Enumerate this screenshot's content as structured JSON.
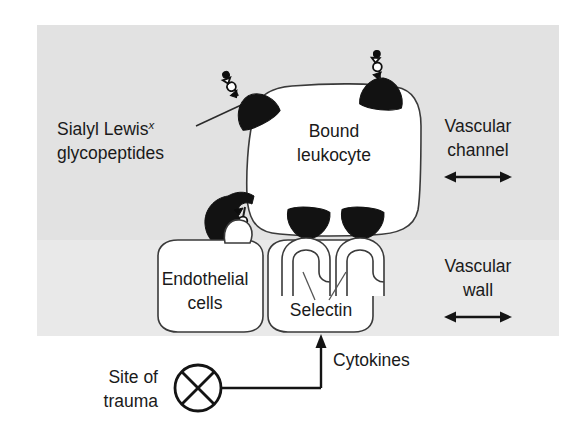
{
  "figure": {
    "background_color": "#ffffff",
    "panel_color_upper": "#e3e3e3",
    "panel_color_lower": "#e9e9e9",
    "ink_color": "#1a1a1a"
  },
  "labels": {
    "sialyl_lewis_line1": "Sialyl Lewis",
    "sialyl_lewis_superscript": "x",
    "sialyl_lewis_line2": "glycopeptides",
    "leukocyte_line1": "Bound",
    "leukocyte_line2": "leukocyte",
    "vascular_channel_line1": "Vascular",
    "vascular_channel_line2": "channel",
    "vascular_wall_line1": "Vascular",
    "vascular_wall_line2": "wall",
    "endothelial_line1": "Endothelial",
    "endothelial_line2": "cells",
    "selectin": "Selectin",
    "cytokines": "Cytokines",
    "trauma_line1": "Site of",
    "trauma_line2": "trauma"
  },
  "icons": {
    "glycopeptide": "glycopeptide-anchor-icon",
    "selectin_receptor": "selectin-receptor-icon",
    "trauma_marker": "crossed-circle-icon",
    "channel_arrow": "double-headed-arrow-icon",
    "wall_arrow": "double-headed-arrow-icon",
    "cytokine_arrow": "up-arrow-icon"
  },
  "structures": {
    "leukocyte_count": 1,
    "glycopeptide_anchor_count": 5,
    "selectin_receptor_count": 2,
    "endothelial_cell_count": 2
  }
}
